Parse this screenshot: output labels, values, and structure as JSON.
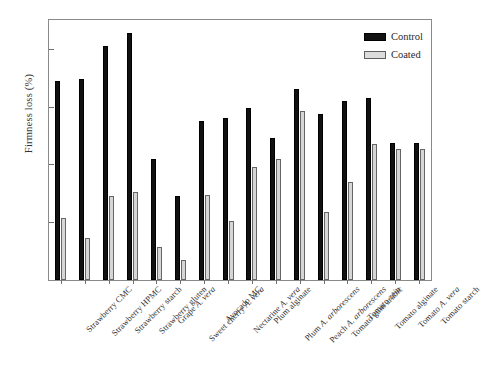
{
  "chart_data": {
    "type": "bar",
    "title": "",
    "xlabel": "",
    "ylabel": "Firmness loss (%)",
    "ylim": [
      0,
      90
    ],
    "yticks": [
      20,
      40,
      60,
      80
    ],
    "grid": false,
    "legend_position": "top-right",
    "categories": [
      "Strawberry CMC",
      "Strawberry HPMC",
      "Strawberry starch",
      "Strawberry gluten",
      "Grape A. vera",
      "Sweet cherry A. vera",
      "Avocado MC",
      "Nectarine A. vera",
      "Plum alginate",
      "Plum A. arborescens",
      "Peach A. arborescens",
      "Tomato gum arabic",
      "Tomato zein",
      "Tomato alginate",
      "Tomato A. vera",
      "Tomato starch"
    ],
    "category_parts": [
      {
        "plain": "Strawberry CMC",
        "italic": ""
      },
      {
        "plain": "Strawberry HPMC",
        "italic": ""
      },
      {
        "plain": "Strawberry starch",
        "italic": ""
      },
      {
        "plain": "Strawberry gluten",
        "italic": ""
      },
      {
        "plain": "Grape ",
        "italic": "A. vera"
      },
      {
        "plain": "Sweet cherry ",
        "italic": "A. vera"
      },
      {
        "plain": "Avocado MC",
        "italic": ""
      },
      {
        "plain": "Nectarine ",
        "italic": "A. vera"
      },
      {
        "plain": "Plum alginate",
        "italic": ""
      },
      {
        "plain": "Plum ",
        "italic": "A. arborescens"
      },
      {
        "plain": "Peach ",
        "italic": "A. arborescens"
      },
      {
        "plain": "Tomato gum arabic",
        "italic": ""
      },
      {
        "plain": "Tomato zein",
        "italic": ""
      },
      {
        "plain": "Tomato alginate",
        "italic": ""
      },
      {
        "plain": "Tomato ",
        "italic": "A. vera"
      },
      {
        "plain": "Tomato starch",
        "italic": ""
      }
    ],
    "series": [
      {
        "name": "Control",
        "color": "#111111",
        "values": [
          69,
          69.5,
          81,
          85.5,
          42,
          29,
          55,
          56,
          59.5,
          49,
          66,
          57.5,
          62,
          63,
          47.5,
          47.5
        ]
      },
      {
        "name": "Coated",
        "color": "#d6d6d6",
        "values": [
          21.5,
          14.5,
          29,
          30.5,
          11.5,
          7,
          29.5,
          20.5,
          39,
          42,
          58.5,
          23.5,
          34,
          47,
          45.5,
          45.5
        ]
      }
    ]
  },
  "legend": {
    "items": [
      {
        "label": "Control"
      },
      {
        "label": "Coated"
      }
    ]
  }
}
